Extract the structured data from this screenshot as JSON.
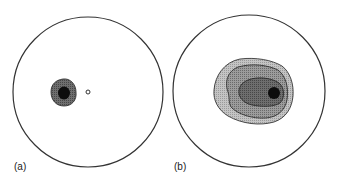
{
  "figure": {
    "panels": [
      {
        "label": "(a)",
        "description": "Stereonet plot with a single small concentrated contour cluster left of center and a small open circle marking the center",
        "contour_levels": 2,
        "colors": {
          "outer": "#5a5a5a",
          "inner": "#0d0d0d"
        }
      },
      {
        "label": "(b)",
        "description": "Stereonet plot with a broader multi-level contour cluster near center, maximum offset to the right",
        "contour_levels": 4,
        "colors": {
          "level1": "#b8b8b8",
          "level2": "#8c8c8c",
          "level3": "#5e5e5e",
          "level4": "#0d0d0d"
        }
      }
    ]
  }
}
